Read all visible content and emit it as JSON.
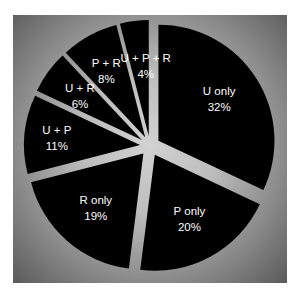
{
  "chart_data": {
    "type": "pie",
    "title": "",
    "slices": [
      {
        "label": "U only",
        "value": 32,
        "text": "32%"
      },
      {
        "label": "P only",
        "value": 20,
        "text": "20%"
      },
      {
        "label": "R only",
        "value": 19,
        "text": "19%"
      },
      {
        "label": "U + P",
        "value": 11,
        "text": "11%"
      },
      {
        "label": "U + R",
        "value": 6,
        "text": "6%"
      },
      {
        "label": "P + R",
        "value": 8,
        "text": "8%"
      },
      {
        "label": "U + P + R",
        "value": 4,
        "text": "4%"
      }
    ],
    "exploded": true,
    "slice_color": "#000000",
    "background": "gray vignette"
  }
}
